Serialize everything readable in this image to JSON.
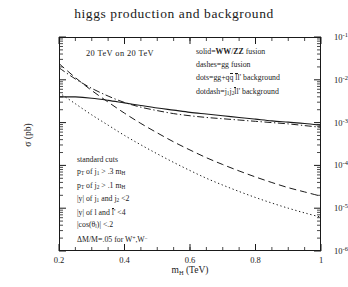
{
  "title": "higgs production and background",
  "axes": {
    "xlabel_main": "m",
    "xlabel_sub": "H",
    "xlabel_unit": "(TeV)",
    "ylabel": "σ (pb)",
    "xticks": [
      "0.2",
      "0.4",
      "0.6",
      "0.8",
      "1"
    ],
    "xtick_values": [
      0.2,
      0.4,
      0.6,
      0.8,
      1.0
    ],
    "ytick_exponents": [
      "-1",
      "-2",
      "-3",
      "-4",
      "-5",
      "-6"
    ],
    "ytick_mantissa": "10",
    "xlim": [
      0.2,
      1.0
    ],
    "ylim_log10": [
      -6,
      -1
    ]
  },
  "beam_label": "20 TeV on 20 TeV",
  "legend": {
    "entries": [
      {
        "key": "solid",
        "text_prefix": "solid=",
        "text_body": "WW/ZZ fusion",
        "style": "solid"
      },
      {
        "key": "dashes",
        "text_prefix": "dashes=",
        "text_body": "gg fusion",
        "style": "dashed"
      },
      {
        "key": "dots",
        "text_prefix": "dots=",
        "text_body": "gg+qq̄ l̄l' background",
        "style": "dotted"
      },
      {
        "key": "dotdash",
        "text_prefix": "dotdash=",
        "text_body": "j₁j₂ l̄l' background",
        "style": "dotdash"
      }
    ]
  },
  "cuts": {
    "heading": "standard cuts",
    "lines": [
      "p_T of j_1 > .3 m_H",
      "p_T of j_2 > .1 m_H",
      "|y| of j_1 and j_2 <2",
      "|y| of l and l' <4",
      "|cos(theta_l)| <.2",
      "DeltaM/M=.05 for W+,W-"
    ]
  },
  "chart_data": {
    "type": "line",
    "title": "higgs production and background",
    "xlabel": "m_H (TeV)",
    "ylabel": "σ (pb)",
    "xlim": [
      0.2,
      1.0
    ],
    "ylim": [
      1e-06,
      0.1
    ],
    "yscale": "log",
    "xscale": "linear",
    "grid": false,
    "legend_position": "upper-right-inside",
    "series": [
      {
        "name": "WW/ZZ fusion",
        "style": "solid",
        "x": [
          0.2,
          0.25,
          0.3,
          0.35,
          0.4,
          0.45,
          0.5,
          0.55,
          0.6,
          0.65,
          0.7,
          0.75,
          0.8,
          0.85,
          0.9,
          0.95,
          1.0
        ],
        "log10y": [
          -2.4,
          -2.4,
          -2.43,
          -2.48,
          -2.54,
          -2.6,
          -2.66,
          -2.71,
          -2.76,
          -2.8,
          -2.84,
          -2.88,
          -2.92,
          -2.96,
          -2.99,
          -3.02,
          -3.06
        ]
      },
      {
        "name": "gg fusion",
        "style": "dashed",
        "x": [
          0.2,
          0.25,
          0.3,
          0.35,
          0.4,
          0.45,
          0.5,
          0.55,
          0.6,
          0.65,
          0.7,
          0.75,
          0.8,
          0.85,
          0.9,
          0.95,
          1.0
        ],
        "log10y": [
          -1.62,
          -1.95,
          -2.25,
          -2.52,
          -2.78,
          -3.02,
          -3.24,
          -3.45,
          -3.64,
          -3.82,
          -3.98,
          -4.13,
          -4.27,
          -4.4,
          -4.52,
          -4.62,
          -4.72
        ]
      },
      {
        "name": "gg+qq̄ l̄l' background",
        "style": "dotted",
        "x": [
          0.2,
          0.25,
          0.3,
          0.35,
          0.4,
          0.45,
          0.5,
          0.55,
          0.6,
          0.65,
          0.7,
          0.75,
          0.8,
          0.85,
          0.9,
          0.95,
          1.0
        ],
        "log10y": [
          -2.3,
          -2.56,
          -2.82,
          -3.06,
          -3.3,
          -3.52,
          -3.73,
          -3.93,
          -4.12,
          -4.3,
          -4.46,
          -4.61,
          -4.75,
          -4.88,
          -5.0,
          -5.11,
          -5.21
        ]
      },
      {
        "name": "j₁j₂ l̄l' background",
        "style": "dotdash",
        "x": [
          0.2,
          0.25,
          0.3,
          0.35,
          0.4,
          0.45,
          0.5,
          0.55,
          0.6,
          0.65,
          0.7,
          0.75,
          0.8,
          0.85,
          0.9,
          0.95,
          1.0
        ],
        "log10y": [
          -1.72,
          -1.98,
          -2.2,
          -2.38,
          -2.53,
          -2.64,
          -2.72,
          -2.79,
          -2.84,
          -2.88,
          -2.91,
          -2.94,
          -2.97,
          -3.0,
          -3.03,
          -3.07,
          -3.11
        ]
      }
    ]
  }
}
